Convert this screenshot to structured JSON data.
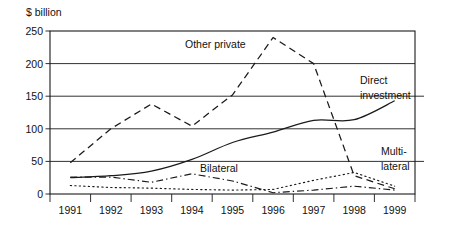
{
  "chart_data": {
    "type": "line",
    "title": "",
    "subtitle": "",
    "xlabel": "",
    "ylabel": "$ billion",
    "unit_label": "$ billion",
    "x": [
      1991,
      1992,
      1993,
      1994,
      1995,
      1996,
      1997,
      1998,
      1999
    ],
    "categories": [
      "1991",
      "1992",
      "1993",
      "1994",
      "1995",
      "1996",
      "1997",
      "1998",
      "1999"
    ],
    "xlim": [
      1990.6,
      1999.4
    ],
    "ylim": [
      0,
      250
    ],
    "yticks": [
      0,
      50,
      100,
      150,
      200,
      250
    ],
    "ytick_labels": [
      "0",
      "50",
      "100",
      "150",
      "200",
      "250"
    ],
    "grid": "horizontal",
    "legend": "inline-annotations",
    "series": [
      {
        "name": "Other private",
        "label": "Other private",
        "style": "dashed",
        "values": [
          48,
          100,
          138,
          104,
          152,
          240,
          200,
          28,
          8
        ]
      },
      {
        "name": "Direct investment",
        "label": "Direct investment",
        "label_lines": [
          "Direct",
          "investment"
        ],
        "style": "solid",
        "values": [
          25,
          28,
          35,
          53,
          79,
          95,
          113,
          114,
          143
        ]
      },
      {
        "name": "Bilateral",
        "label": "Bilateral",
        "style": "dash-dot",
        "values": [
          26,
          26,
          18,
          31,
          20,
          2,
          6,
          12,
          6
        ]
      },
      {
        "name": "Multilateral",
        "label": "Multi-lateral",
        "label_lines": [
          "Multi-",
          "lateral"
        ],
        "style": "dotted",
        "values": [
          13,
          10,
          9,
          7,
          6,
          7,
          21,
          33,
          12
        ]
      }
    ],
    "annotations": [
      {
        "text": "Other private",
        "series": "Other private"
      },
      {
        "text": "Direct investment",
        "series": "Direct investment"
      },
      {
        "text": "Bilateral",
        "series": "Bilateral"
      },
      {
        "text": "Multi-lateral",
        "series": "Multilateral"
      }
    ],
    "colors": {
      "line": "#1a1a1a",
      "grid": "#1a1a1a",
      "background": "#ffffff",
      "text": "#111111"
    }
  },
  "labels": {
    "unit": "$ billion",
    "other_private": "Other private",
    "direct_1": "Direct",
    "direct_2": "investment",
    "bilateral": "Bilateral",
    "multi_1": "Multi-",
    "multi_2": "lateral",
    "y0": "0",
    "y50": "50",
    "y100": "100",
    "y150": "150",
    "y200": "200",
    "y250": "250",
    "x1991": "1991",
    "x1992": "1992",
    "x1993": "1993",
    "x1994": "1994",
    "x1995": "1995",
    "x1996": "1996",
    "x1997": "1997",
    "x1998": "1998",
    "x1999": "1999"
  }
}
